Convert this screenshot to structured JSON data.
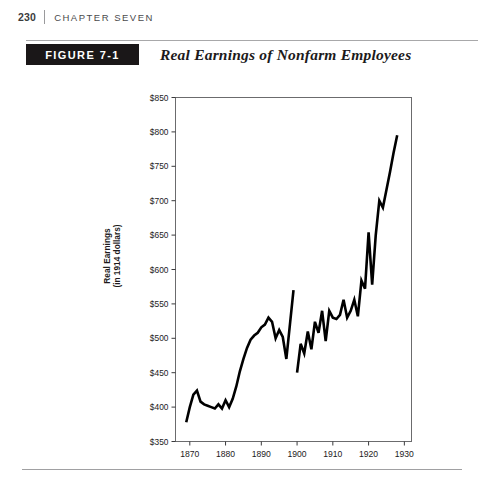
{
  "page": {
    "folio": "230",
    "chapter": "CHAPTER SEVEN"
  },
  "figure": {
    "tab_label": "FIGURE 7-1",
    "title": "Real Earnings of Nonfarm Employees"
  },
  "chart_data": {
    "type": "line",
    "title": "Real Earnings of Nonfarm Employees",
    "xlabel": "",
    "ylabel": "Real Earnings\n(in 1914 dollars)",
    "ylabel_line1": "Real Earnings",
    "ylabel_line2": "(in 1914 dollars)",
    "xlim": [
      1866,
      1932
    ],
    "ylim": [
      350,
      850
    ],
    "ytick_values": [
      350,
      400,
      450,
      500,
      550,
      600,
      650,
      700,
      750,
      800,
      850
    ],
    "ytick_labels": [
      "$350",
      "$400",
      "$450",
      "$500",
      "$550",
      "$600",
      "$650",
      "$700",
      "$750",
      "$800",
      "$850"
    ],
    "xtick_values": [
      1870,
      1880,
      1890,
      1900,
      1910,
      1920,
      1930
    ],
    "xtick_labels": [
      "1870",
      "1880",
      "1890",
      "1900",
      "1910",
      "1920",
      "1930"
    ],
    "grid": false,
    "legend": null,
    "line_color": "#000000",
    "line_width": 2.6,
    "series": [
      {
        "name": "Real earnings 1869-1899",
        "x": [
          1869,
          1870,
          1871,
          1872,
          1873,
          1874,
          1875,
          1876,
          1877,
          1878,
          1879,
          1880,
          1881,
          1882,
          1883,
          1884,
          1885,
          1886,
          1887,
          1888,
          1889,
          1890,
          1891,
          1892,
          1893,
          1894,
          1895,
          1896,
          1897,
          1898,
          1899
        ],
        "values": [
          378,
          400,
          418,
          424,
          408,
          404,
          402,
          400,
          398,
          404,
          398,
          410,
          400,
          412,
          430,
          452,
          470,
          486,
          498,
          504,
          508,
          516,
          520,
          530,
          524,
          500,
          512,
          502,
          470,
          520,
          570
        ]
      },
      {
        "name": "Real earnings 1900-1928",
        "x": [
          1900,
          1901,
          1902,
          1903,
          1904,
          1905,
          1906,
          1907,
          1908,
          1909,
          1910,
          1911,
          1912,
          1913,
          1914,
          1915,
          1916,
          1917,
          1918,
          1919,
          1920,
          1921,
          1922,
          1923,
          1924,
          1925,
          1926,
          1927,
          1928
        ],
        "values": [
          450,
          492,
          478,
          510,
          484,
          524,
          508,
          540,
          496,
          540,
          530,
          528,
          534,
          556,
          530,
          540,
          556,
          532,
          584,
          572,
          654,
          578,
          650,
          700,
          690,
          716,
          742,
          770,
          795
        ]
      }
    ]
  },
  "axes": {
    "frame_color": "#5a5a5c"
  }
}
